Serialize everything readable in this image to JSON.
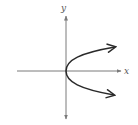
{
  "diagram": {
    "title": "",
    "type": "coordinate-plane-parabola",
    "axes": {
      "x_label": "x",
      "y_label": "y"
    },
    "curve": {
      "equation": "x = y^2",
      "vertex": [
        0,
        0
      ],
      "opens": "right",
      "arrows_at_ends": true
    },
    "colors": {
      "axis": "#7a7a7a",
      "curve": "#2a2a2a",
      "background": "#ffffff"
    }
  }
}
